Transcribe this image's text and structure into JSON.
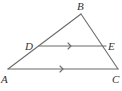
{
  "diagram": {
    "type": "triangle-with-parallel-segment",
    "colors": {
      "stroke": "#6b6b6b",
      "label": "#333333",
      "background": "#ffffff"
    },
    "points": {
      "A": {
        "label": "A",
        "x": 8,
        "y": 69
      },
      "B": {
        "label": "B",
        "x": 81,
        "y": 14
      },
      "C": {
        "label": "C",
        "x": 118,
        "y": 69
      },
      "D": {
        "label": "D",
        "x": 39,
        "y": 46
      },
      "E": {
        "label": "E",
        "x": 106,
        "y": 46
      }
    },
    "segments": [
      {
        "from": "A",
        "to": "B"
      },
      {
        "from": "B",
        "to": "C"
      },
      {
        "from": "A",
        "to": "C",
        "parallel_mark": true
      },
      {
        "from": "D",
        "to": "E",
        "parallel_mark": true
      }
    ],
    "annotations": [
      "DE ∥ AC"
    ]
  }
}
